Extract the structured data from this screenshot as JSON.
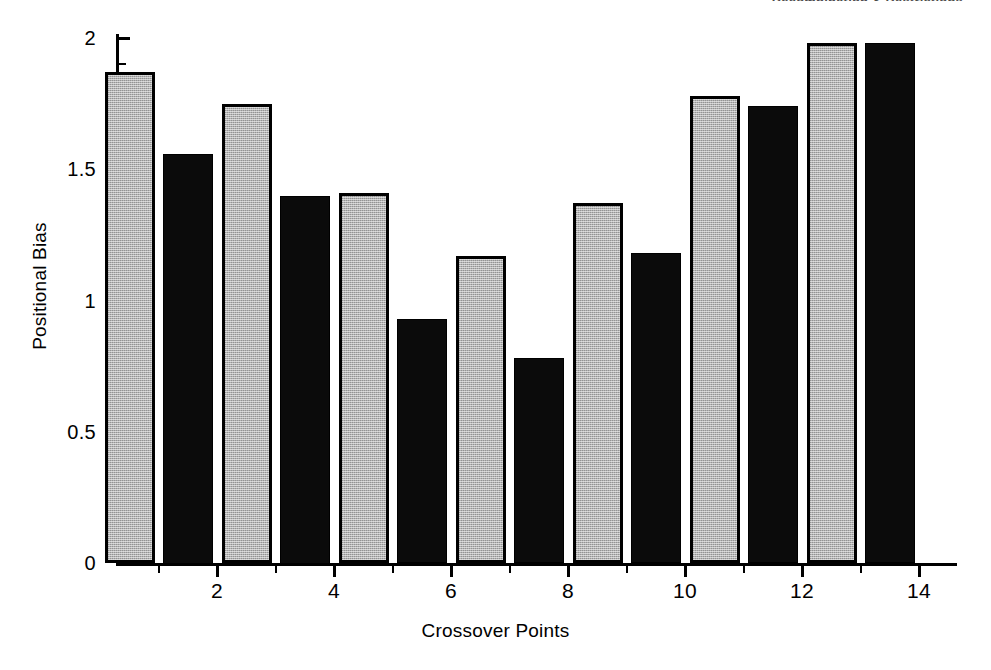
{
  "header": {
    "running_head": "Recombination & Restrictions"
  },
  "chart_data": {
    "type": "bar",
    "title": "",
    "xlabel": "Crossover Points",
    "ylabel": "Positional Bias",
    "xlim": [
      0,
      15
    ],
    "ylim": [
      0,
      2
    ],
    "grid": false,
    "legend": "none",
    "x_major_ticks": [
      2,
      4,
      6,
      8,
      10,
      12,
      14
    ],
    "x_minor_ticks": [
      1,
      3,
      5,
      7,
      9,
      11,
      13,
      15
    ],
    "y_major_ticks": [
      0,
      0.5,
      1,
      1.5,
      2
    ],
    "y_major_tick_labels": [
      "0",
      "0.5",
      "1",
      "1.5",
      "2"
    ],
    "y_minor_ticks": [
      0.1,
      0.2,
      0.3,
      0.4,
      0.6,
      0.7,
      0.8,
      0.9,
      1.1,
      1.2,
      1.3,
      1.4,
      1.6,
      1.7,
      1.8,
      1.9
    ],
    "categories": [
      1,
      2,
      3,
      4,
      5,
      6,
      7,
      8,
      9,
      10,
      11,
      12,
      13,
      14
    ],
    "values": [
      1.87,
      1.56,
      1.75,
      1.4,
      1.41,
      0.93,
      1.17,
      0.78,
      1.37,
      1.18,
      1.78,
      1.74,
      1.98,
      1.98
    ],
    "bar_styles": [
      "gray",
      "black",
      "gray",
      "black",
      "gray",
      "black",
      "gray",
      "black",
      "gray",
      "black",
      "gray",
      "black",
      "gray",
      "black"
    ],
    "colors": {
      "gray_fill": "#b3b3b3",
      "black_fill": "#0b0b0b",
      "outline": "#000000",
      "background": "#ffffff"
    }
  }
}
